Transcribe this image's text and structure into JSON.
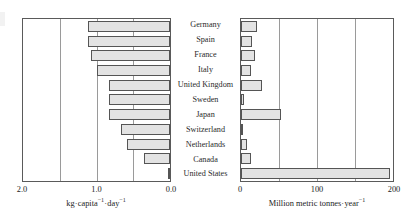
{
  "chart_data": {
    "type": "bar",
    "title": "",
    "orientation": "horizontal",
    "panels": [
      {
        "name": "per-capita-waste",
        "xlabel": "kg·capita⁻¹·day⁻¹",
        "xlabel_parts": {
          "a": "kg",
          "dot1": "·",
          "b": "capita",
          "sup1": "−1",
          "dot2": "·",
          "c": "day",
          "sup2": "−1"
        },
        "xlim": [
          2.0,
          0.0
        ],
        "reversed": true,
        "ticks": [
          2.0,
          1.0,
          0.0
        ],
        "tick_labels": [
          "2.0",
          "1.0",
          "0.0"
        ],
        "gridlines": [
          2.0,
          1.5,
          1.0,
          0.5,
          0.0
        ],
        "grid": true,
        "values": [
          0.88,
          0.88,
          0.92,
          1.0,
          1.17,
          1.17,
          1.17,
          1.33,
          1.42,
          1.65,
          2.0
        ]
      },
      {
        "name": "total-waste",
        "xlabel": "Million metric tonnes·year⁻¹",
        "xlabel_parts": {
          "a": "Million metric tonnes",
          "dot1": "·",
          "b": "year",
          "sup1": "−1"
        },
        "xlim": [
          0,
          200
        ],
        "reversed": false,
        "ticks": [
          0,
          100,
          200
        ],
        "tick_labels": [
          "0",
          "100",
          "200"
        ],
        "gridlines": [
          0,
          50,
          100,
          150,
          200
        ],
        "grid": true,
        "values": [
          21,
          14,
          18,
          13,
          27,
          4,
          52,
          3,
          8,
          13,
          196
        ]
      }
    ],
    "categories": [
      "Germany",
      "Spain",
      "France",
      "Italy",
      "United Kingdom",
      "Sweden",
      "Japan",
      "Switzerland",
      "Netherlands",
      "Canada",
      "United States"
    ],
    "series": [
      {
        "name": "kg·capita⁻¹·day⁻¹",
        "values": [
          0.88,
          0.88,
          0.92,
          1.0,
          1.17,
          1.17,
          1.17,
          1.33,
          1.42,
          1.65,
          2.0
        ]
      },
      {
        "name": "Million metric tonnes·year⁻¹",
        "values": [
          21,
          14,
          18,
          13,
          27,
          4,
          52,
          3,
          8,
          13,
          196
        ]
      }
    ],
    "colors": {
      "bar_fill": "#e3e3e3",
      "bar_edge": "#555555",
      "frame": "#5a5a5a",
      "grid": "#9a9a9a",
      "text": "#1d1d1d",
      "background": "#ffffff"
    },
    "legend": null,
    "legend_position": "none"
  }
}
